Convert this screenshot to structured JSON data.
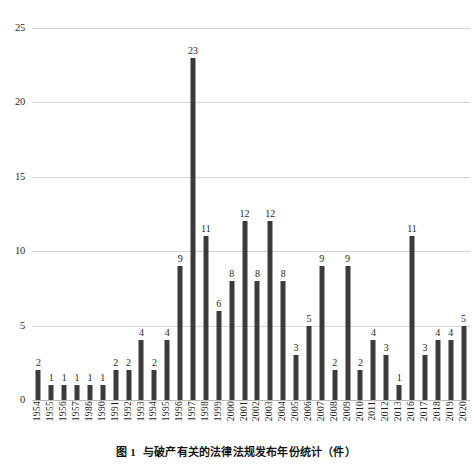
{
  "caption": {
    "number": "图 1",
    "text": "与破产有关的法律法规发布年份统计（件）"
  },
  "chart_data": {
    "type": "bar",
    "title": "与破产有关的法律法规发布年份统计（件）",
    "xlabel": "",
    "ylabel": "",
    "ylim": [
      0,
      25
    ],
    "yticks": [
      0,
      5,
      10,
      15,
      20,
      25
    ],
    "grid": true,
    "legend": null,
    "bar_color": "#3b3b3b",
    "data_labels": true,
    "categories": [
      "1954",
      "1955",
      "1956",
      "1957",
      "1986",
      "1990",
      "1991",
      "1992",
      "1993",
      "1994",
      "1995",
      "1996",
      "1997",
      "1998",
      "1999",
      "2000",
      "2001",
      "2002",
      "2003",
      "2004",
      "2005",
      "2006",
      "2007",
      "2008",
      "2009",
      "2010",
      "2011",
      "2012",
      "2013",
      "2016",
      "2017",
      "2018",
      "2019",
      "2020"
    ],
    "values": [
      2,
      1,
      1,
      1,
      1,
      1,
      2,
      2,
      4,
      2,
      4,
      9,
      23,
      11,
      6,
      8,
      12,
      8,
      12,
      8,
      3,
      5,
      9,
      2,
      9,
      2,
      4,
      3,
      1,
      11,
      3,
      4,
      4,
      5
    ]
  }
}
